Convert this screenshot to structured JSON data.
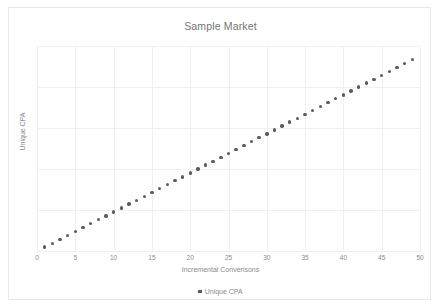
{
  "chart_data": {
    "type": "scatter",
    "title": "Sample Market",
    "xlabel": "Incremental Converisons",
    "ylabel": "Unique CPA",
    "xlim": [
      0,
      50
    ],
    "ylim": [
      0,
      105
    ],
    "xticks": [
      0,
      5,
      10,
      15,
      20,
      25,
      30,
      35,
      40,
      45,
      50
    ],
    "yticks": [],
    "grid": true,
    "legend_position": "bottom",
    "marker_color": "#5b5b5b",
    "series": [
      {
        "name": "Unique CPA",
        "x": [
          1,
          2,
          3,
          4,
          5,
          6,
          7,
          8,
          9,
          10,
          11,
          12,
          13,
          14,
          15,
          16,
          17,
          18,
          19,
          20,
          21,
          22,
          23,
          24,
          25,
          26,
          27,
          28,
          29,
          30,
          31,
          32,
          33,
          34,
          35,
          36,
          37,
          38,
          39,
          40,
          41,
          42,
          43,
          44,
          45,
          46,
          47,
          48,
          49
        ],
        "y": [
          2,
          4,
          6,
          8,
          10,
          12,
          14,
          16,
          18,
          20,
          22,
          24,
          26,
          28,
          30,
          32,
          34,
          36,
          38,
          40,
          42,
          44,
          46,
          48,
          50,
          52,
          54,
          56,
          58,
          60,
          62,
          64,
          66,
          68,
          70,
          72,
          74,
          76,
          78,
          80,
          82,
          84,
          86,
          88,
          90,
          92,
          94,
          96,
          98
        ]
      }
    ]
  },
  "legend": {
    "items": [
      {
        "label": "Unique CPA",
        "color": "#5b5b5b"
      }
    ]
  }
}
